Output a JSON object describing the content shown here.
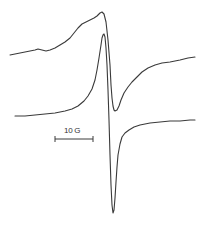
{
  "chart_data": {
    "type": "line",
    "title": "",
    "xlabel": "Magnetic field",
    "ylabel": "",
    "grid": false,
    "legend": null,
    "annotations": [
      {
        "text": "10 G",
        "kind": "scale-bar"
      }
    ],
    "series": [
      {
        "name": "upper trace (broad EPR derivative)",
        "points": [
          [
            10,
            55
          ],
          [
            20,
            53
          ],
          [
            30,
            51
          ],
          [
            35,
            50
          ],
          [
            38,
            49
          ],
          [
            42,
            50
          ],
          [
            46,
            51
          ],
          [
            50,
            50
          ],
          [
            55,
            48
          ],
          [
            60,
            45
          ],
          [
            65,
            42
          ],
          [
            70,
            38
          ],
          [
            74,
            33
          ],
          [
            78,
            28
          ],
          [
            82,
            24
          ],
          [
            86,
            22
          ],
          [
            90,
            20
          ],
          [
            94,
            18
          ],
          [
            97,
            16
          ],
          [
            100,
            13
          ],
          [
            102,
            12
          ],
          [
            104,
            14
          ],
          [
            106,
            22
          ],
          [
            108,
            40
          ],
          [
            110,
            65
          ],
          [
            111,
            85
          ],
          [
            112,
            98
          ],
          [
            113,
            106
          ],
          [
            114,
            110
          ],
          [
            115,
            111
          ],
          [
            117,
            110
          ],
          [
            119,
            106
          ],
          [
            121,
            100
          ],
          [
            124,
            93
          ],
          [
            128,
            87
          ],
          [
            132,
            82
          ],
          [
            137,
            77
          ],
          [
            142,
            72
          ],
          [
            148,
            68
          ],
          [
            155,
            65
          ],
          [
            162,
            63
          ],
          [
            170,
            62
          ],
          [
            180,
            60
          ],
          [
            188,
            58
          ],
          [
            195,
            57
          ]
        ]
      },
      {
        "name": "lower trace (narrow EPR derivative)",
        "points": [
          [
            15,
            116
          ],
          [
            25,
            116
          ],
          [
            35,
            115
          ],
          [
            45,
            114
          ],
          [
            55,
            113
          ],
          [
            65,
            111
          ],
          [
            72,
            109
          ],
          [
            78,
            106
          ],
          [
            84,
            101
          ],
          [
            88,
            96
          ],
          [
            92,
            89
          ],
          [
            95,
            80
          ],
          [
            97,
            70
          ],
          [
            99,
            58
          ],
          [
            101,
            45
          ],
          [
            102,
            38
          ],
          [
            103,
            35
          ],
          [
            104,
            34
          ],
          [
            105,
            37
          ],
          [
            106,
            48
          ],
          [
            107,
            65
          ],
          [
            108,
            90
          ],
          [
            109,
            120
          ],
          [
            110,
            155
          ],
          [
            111,
            185
          ],
          [
            112,
            205
          ],
          [
            113,
            213
          ],
          [
            114,
            210
          ],
          [
            115,
            198
          ],
          [
            116,
            182
          ],
          [
            117,
            167
          ],
          [
            118,
            155
          ],
          [
            120,
            144
          ],
          [
            122,
            137
          ],
          [
            125,
            133
          ],
          [
            129,
            130
          ],
          [
            134,
            127
          ],
          [
            140,
            125
          ],
          [
            150,
            123
          ],
          [
            160,
            122
          ],
          [
            170,
            121
          ],
          [
            180,
            121
          ],
          [
            190,
            120
          ],
          [
            195,
            120
          ]
        ]
      }
    ],
    "scale_bar": {
      "label": "10 G",
      "x1": 55,
      "x2": 93,
      "y": 139
    }
  },
  "scale_label": "10 G"
}
